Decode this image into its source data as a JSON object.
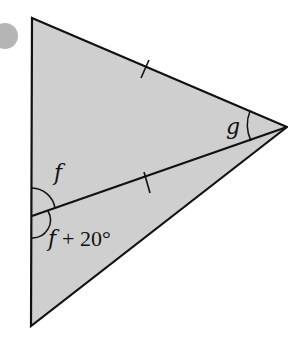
{
  "diagram": {
    "type": "geometry-triangle",
    "fill_color": "#cfcfcf",
    "stroke_color": "#111111",
    "marker_color": "#b5b5b5",
    "vertices": {
      "top_left": [
        32,
        18
      ],
      "right": [
        287,
        127
      ],
      "bottom_left": [
        31,
        326
      ]
    },
    "cevian_foot": [
      32,
      216
    ],
    "angle_labels": {
      "f": "f",
      "f_plus": "f",
      "plus_20": "+ 20°",
      "g": "g"
    },
    "equal_tick_marks": 2
  }
}
